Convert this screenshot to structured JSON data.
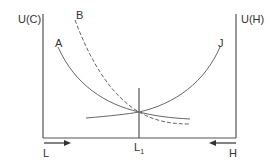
{
  "diagram": {
    "axes": {
      "left_label": "U(C)",
      "right_label": "U(H)",
      "bottom_left_label": "L",
      "bottom_right_label": "H",
      "center_marker_label": "L",
      "center_marker_subscript": "1"
    },
    "curves": [
      {
        "id": "A",
        "label": "A",
        "style": "solid",
        "description": "decreasing convex curve from upper-left"
      },
      {
        "id": "B",
        "label": "B",
        "style": "dashed",
        "description": "steep decreasing dashed curve from top"
      },
      {
        "id": "J",
        "label": "J",
        "style": "solid",
        "description": "increasing convex curve to upper-right"
      }
    ],
    "arrows": {
      "left": "right-pointing arrow under L",
      "right": "left-pointing arrow over H"
    },
    "colors": {
      "line": "#555555",
      "background": "#ffffff"
    }
  }
}
